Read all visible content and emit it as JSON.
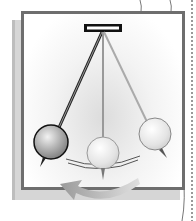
{
  "illustration": {
    "subject": "pendulum swing diagram",
    "pendulum_count": 3,
    "motion_direction": "counter-clockwise arrow (swing right to left)",
    "colors": {
      "frame": "#6e6e6e",
      "back_card": "#d6d6d6",
      "mount": "#111111",
      "bob_active": "#9a9a9a",
      "bob_ghost": "#e8e8e8",
      "arrow": "#a8a8a8"
    }
  }
}
